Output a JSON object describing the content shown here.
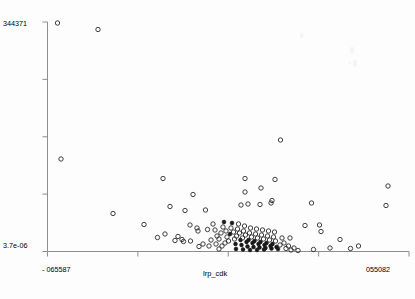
{
  "figure": {
    "background_color": "#fdfdfd",
    "axis_color": "#8e8e8e",
    "marker_color": "#2b2b2b"
  },
  "labels": {
    "y_top": "344371",
    "y_bottom": "3.7e-06",
    "x_left": "- 065587",
    "x_right": "055082",
    "x_title": "lrp_cdk"
  },
  "chart_data": {
    "type": "scatter",
    "title": "",
    "xlabel": "lrp_cdk",
    "ylabel": "",
    "grid": false,
    "legend": null,
    "xlim": [
      -0.065587,
      0.055082
    ],
    "ylim": [
      3.7e-06,
      344371
    ],
    "x_ticks": [
      -0.065587,
      -0.035419,
      -0.005252,
      0.024915,
      0.055082
    ],
    "x_tick_labels": [
      "- 065587",
      "",
      "",
      "",
      "055082"
    ],
    "y_ticks": [
      3.7e-06,
      86092.75,
      172185.5,
      258278.25,
      344371
    ],
    "y_tick_labels": [
      "3.7e-06",
      "",
      "",
      "",
      "344371"
    ],
    "marker": "open-circle",
    "n_points": 118,
    "points": [
      {
        "x": 57.5,
        "y": 23.0,
        "t": "o"
      },
      {
        "x": 98.0,
        "y": 29.5,
        "t": "o"
      },
      {
        "x": 61.0,
        "y": 159.0,
        "t": "o"
      },
      {
        "x": 280.5,
        "y": 140.0,
        "t": "o"
      },
      {
        "x": 163.0,
        "y": 178.5,
        "t": "o"
      },
      {
        "x": 245.0,
        "y": 178.5,
        "t": "o"
      },
      {
        "x": 275.0,
        "y": 179.5,
        "t": "o"
      },
      {
        "x": 261.0,
        "y": 188.0,
        "t": "o"
      },
      {
        "x": 245.0,
        "y": 192.0,
        "t": "o"
      },
      {
        "x": 388.0,
        "y": 186.0,
        "t": "o"
      },
      {
        "x": 193.0,
        "y": 194.5,
        "t": "o"
      },
      {
        "x": 113.0,
        "y": 213.5,
        "t": "o"
      },
      {
        "x": 170.0,
        "y": 206.5,
        "t": "o"
      },
      {
        "x": 185.0,
        "y": 210.5,
        "t": "o"
      },
      {
        "x": 205.5,
        "y": 210.0,
        "t": "o"
      },
      {
        "x": 248.0,
        "y": 204.0,
        "t": "o"
      },
      {
        "x": 260.0,
        "y": 204.5,
        "t": "o"
      },
      {
        "x": 241.0,
        "y": 205.0,
        "t": "o"
      },
      {
        "x": 271.0,
        "y": 203.0,
        "t": "o"
      },
      {
        "x": 272.0,
        "y": 200.5,
        "t": "o"
      },
      {
        "x": 311.5,
        "y": 203.0,
        "t": "o"
      },
      {
        "x": 386.0,
        "y": 205.5,
        "t": "o"
      },
      {
        "x": 144.0,
        "y": 224.5,
        "t": "o"
      },
      {
        "x": 190.0,
        "y": 225.0,
        "t": "o"
      },
      {
        "x": 197.0,
        "y": 228.0,
        "t": "o"
      },
      {
        "x": 198.0,
        "y": 231.0,
        "t": "o"
      },
      {
        "x": 207.5,
        "y": 229.5,
        "t": "o"
      },
      {
        "x": 213.0,
        "y": 224.0,
        "t": "o"
      },
      {
        "x": 215.0,
        "y": 230.0,
        "t": "o"
      },
      {
        "x": 217.0,
        "y": 236.0,
        "t": "o"
      },
      {
        "x": 219.0,
        "y": 239.0,
        "t": "o"
      },
      {
        "x": 221.0,
        "y": 233.0,
        "t": "o"
      },
      {
        "x": 223.0,
        "y": 227.0,
        "t": "o"
      },
      {
        "x": 224.0,
        "y": 222.0,
        "t": "s"
      },
      {
        "x": 226.0,
        "y": 231.0,
        "t": "o"
      },
      {
        "x": 227.0,
        "y": 237.0,
        "t": "o"
      },
      {
        "x": 228.5,
        "y": 241.0,
        "t": "o"
      },
      {
        "x": 230.0,
        "y": 234.0,
        "t": "s"
      },
      {
        "x": 231.0,
        "y": 228.0,
        "t": "o"
      },
      {
        "x": 232.0,
        "y": 223.0,
        "t": "s"
      },
      {
        "x": 233.5,
        "y": 232.0,
        "t": "o"
      },
      {
        "x": 234.5,
        "y": 239.0,
        "t": "o"
      },
      {
        "x": 235.5,
        "y": 244.0,
        "t": "s"
      },
      {
        "x": 236.5,
        "y": 236.0,
        "t": "o"
      },
      {
        "x": 237.5,
        "y": 229.0,
        "t": "o"
      },
      {
        "x": 238.5,
        "y": 224.0,
        "t": "o"
      },
      {
        "x": 239.5,
        "y": 233.0,
        "t": "o"
      },
      {
        "x": 240.5,
        "y": 240.0,
        "t": "s"
      },
      {
        "x": 241.5,
        "y": 245.0,
        "t": "s"
      },
      {
        "x": 242.5,
        "y": 238.0,
        "t": "o"
      },
      {
        "x": 243.5,
        "y": 231.0,
        "t": "o"
      },
      {
        "x": 244.5,
        "y": 226.0,
        "t": "o"
      },
      {
        "x": 245.5,
        "y": 235.0,
        "t": "o"
      },
      {
        "x": 246.5,
        "y": 242.0,
        "t": "s"
      },
      {
        "x": 247.5,
        "y": 246.5,
        "t": "s"
      },
      {
        "x": 248.5,
        "y": 240.0,
        "t": "s"
      },
      {
        "x": 249.5,
        "y": 233.0,
        "t": "o"
      },
      {
        "x": 250.5,
        "y": 228.0,
        "t": "o"
      },
      {
        "x": 251.5,
        "y": 237.0,
        "t": "o"
      },
      {
        "x": 252.5,
        "y": 243.0,
        "t": "s"
      },
      {
        "x": 253.5,
        "y": 247.0,
        "t": "s"
      },
      {
        "x": 254.5,
        "y": 241.0,
        "t": "s"
      },
      {
        "x": 255.5,
        "y": 234.0,
        "t": "o"
      },
      {
        "x": 256.5,
        "y": 229.0,
        "t": "o"
      },
      {
        "x": 257.5,
        "y": 238.0,
        "t": "o"
      },
      {
        "x": 258.5,
        "y": 244.0,
        "t": "s"
      },
      {
        "x": 259.5,
        "y": 247.5,
        "t": "s"
      },
      {
        "x": 260.5,
        "y": 242.0,
        "t": "s"
      },
      {
        "x": 261.5,
        "y": 235.0,
        "t": "o"
      },
      {
        "x": 262.5,
        "y": 230.0,
        "t": "o"
      },
      {
        "x": 263.5,
        "y": 239.0,
        "t": "o"
      },
      {
        "x": 264.5,
        "y": 245.0,
        "t": "s"
      },
      {
        "x": 265.5,
        "y": 248.0,
        "t": "s"
      },
      {
        "x": 266.5,
        "y": 243.0,
        "t": "s"
      },
      {
        "x": 267.5,
        "y": 236.0,
        "t": "o"
      },
      {
        "x": 268.5,
        "y": 231.0,
        "t": "o"
      },
      {
        "x": 269.5,
        "y": 240.0,
        "t": "o"
      },
      {
        "x": 270.5,
        "y": 246.0,
        "t": "s"
      },
      {
        "x": 271.5,
        "y": 248.5,
        "t": "s"
      },
      {
        "x": 272.5,
        "y": 244.0,
        "t": "s"
      },
      {
        "x": 273.5,
        "y": 237.0,
        "t": "o"
      },
      {
        "x": 274.5,
        "y": 232.0,
        "t": "o"
      },
      {
        "x": 275.5,
        "y": 241.0,
        "t": "o"
      },
      {
        "x": 276.5,
        "y": 247.0,
        "t": "s"
      },
      {
        "x": 278.0,
        "y": 249.0,
        "t": "s"
      },
      {
        "x": 280.0,
        "y": 245.0,
        "t": "o"
      },
      {
        "x": 282.0,
        "y": 238.0,
        "t": "o"
      },
      {
        "x": 284.0,
        "y": 243.0,
        "t": "o"
      },
      {
        "x": 286.0,
        "y": 248.5,
        "t": "o"
      },
      {
        "x": 288.5,
        "y": 246.0,
        "t": "o"
      },
      {
        "x": 291.0,
        "y": 250.0,
        "t": "o"
      },
      {
        "x": 294.0,
        "y": 248.0,
        "t": "o"
      },
      {
        "x": 298.0,
        "y": 250.5,
        "t": "o"
      },
      {
        "x": 225.0,
        "y": 243.0,
        "t": "o"
      },
      {
        "x": 222.0,
        "y": 246.0,
        "t": "o"
      },
      {
        "x": 219.0,
        "y": 249.0,
        "t": "o"
      },
      {
        "x": 216.0,
        "y": 244.0,
        "t": "o"
      },
      {
        "x": 211.0,
        "y": 240.0,
        "t": "o"
      },
      {
        "x": 209.0,
        "y": 246.0,
        "t": "o"
      },
      {
        "x": 203.0,
        "y": 244.0,
        "t": "o"
      },
      {
        "x": 199.0,
        "y": 246.5,
        "t": "o"
      },
      {
        "x": 182.0,
        "y": 239.5,
        "t": "o"
      },
      {
        "x": 178.0,
        "y": 236.5,
        "t": "o"
      },
      {
        "x": 175.0,
        "y": 240.5,
        "t": "o"
      },
      {
        "x": 183.5,
        "y": 241.5,
        "t": "o"
      },
      {
        "x": 190.5,
        "y": 241.0,
        "t": "o"
      },
      {
        "x": 165.0,
        "y": 234.0,
        "t": "o"
      },
      {
        "x": 157.5,
        "y": 237.5,
        "t": "o"
      },
      {
        "x": 305.0,
        "y": 225.5,
        "t": "o"
      },
      {
        "x": 321.0,
        "y": 231.5,
        "t": "o"
      },
      {
        "x": 319.5,
        "y": 225.0,
        "t": "o"
      },
      {
        "x": 340.0,
        "y": 239.5,
        "t": "o"
      },
      {
        "x": 330.0,
        "y": 248.0,
        "t": "o"
      },
      {
        "x": 350.5,
        "y": 248.5,
        "t": "o"
      },
      {
        "x": 358.5,
        "y": 246.0,
        "t": "o"
      },
      {
        "x": 313.5,
        "y": 249.5,
        "t": "o"
      },
      {
        "x": 290.0,
        "y": 238.0,
        "t": "o"
      },
      {
        "x": 236.0,
        "y": 249.0,
        "t": "s"
      },
      {
        "x": 243.0,
        "y": 249.5,
        "t": "s"
      },
      {
        "x": 250.0,
        "y": 250.0,
        "t": "s"
      },
      {
        "x": 257.0,
        "y": 250.0,
        "t": "s"
      },
      {
        "x": 264.0,
        "y": 249.5,
        "t": "s"
      }
    ],
    "artifacts": [
      {
        "x": 300.0,
        "y": 33.0,
        "w": 3.5,
        "h": 5.0
      },
      {
        "x": 350.5,
        "y": 47.0,
        "w": 3.0,
        "h": 6.0
      },
      {
        "x": 353.0,
        "y": 60.0,
        "w": 4.0,
        "h": 6.5
      },
      {
        "x": 348.5,
        "y": 62.0,
        "w": 2.0,
        "h": 2.0
      }
    ]
  }
}
